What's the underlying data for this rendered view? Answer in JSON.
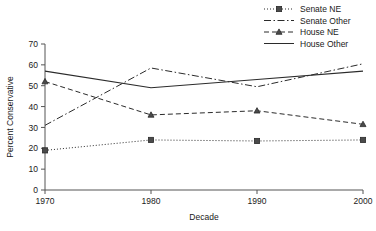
{
  "chart_data": {
    "type": "line",
    "title": "",
    "xlabel": "Decade",
    "ylabel": "Percent Conservative",
    "categories": [
      1970,
      1980,
      1990,
      2000
    ],
    "x_tick_labels": [
      "1970",
      "1980",
      "1990",
      "2000"
    ],
    "y_tick_labels": [
      "0",
      "10",
      "20",
      "30",
      "40",
      "50",
      "60",
      "70"
    ],
    "y_ticks": [
      0,
      10,
      20,
      30,
      40,
      50,
      60,
      70
    ],
    "ylim": [
      0,
      70
    ],
    "xlim": [
      1970,
      2000
    ],
    "grid": false,
    "legend_position": "top-right",
    "series": [
      {
        "name": "Senate NE",
        "values": [
          19,
          24,
          23.5,
          24
        ],
        "line_style": "dotted",
        "marker": "square",
        "color": "#2b2b2b"
      },
      {
        "name": "Senate Other",
        "values": [
          31,
          58.5,
          49.5,
          60.5
        ],
        "line_style": "dash-dot",
        "marker": "none",
        "color": "#2b2b2b"
      },
      {
        "name": "House NE",
        "values": [
          52,
          36,
          38,
          31.5
        ],
        "line_style": "dashed",
        "marker": "triangle",
        "color": "#2b2b2b"
      },
      {
        "name": "House Other",
        "values": [
          57,
          49,
          53,
          57
        ],
        "line_style": "solid",
        "marker": "none",
        "color": "#2b2b2b"
      }
    ]
  },
  "legend": {
    "entries": [
      {
        "label": "Senate NE"
      },
      {
        "label": "Senate Other"
      },
      {
        "label": "House NE"
      },
      {
        "label": "House Other"
      }
    ]
  },
  "axes": {
    "x_title": "Decade",
    "y_title": "Percent Conservative"
  }
}
